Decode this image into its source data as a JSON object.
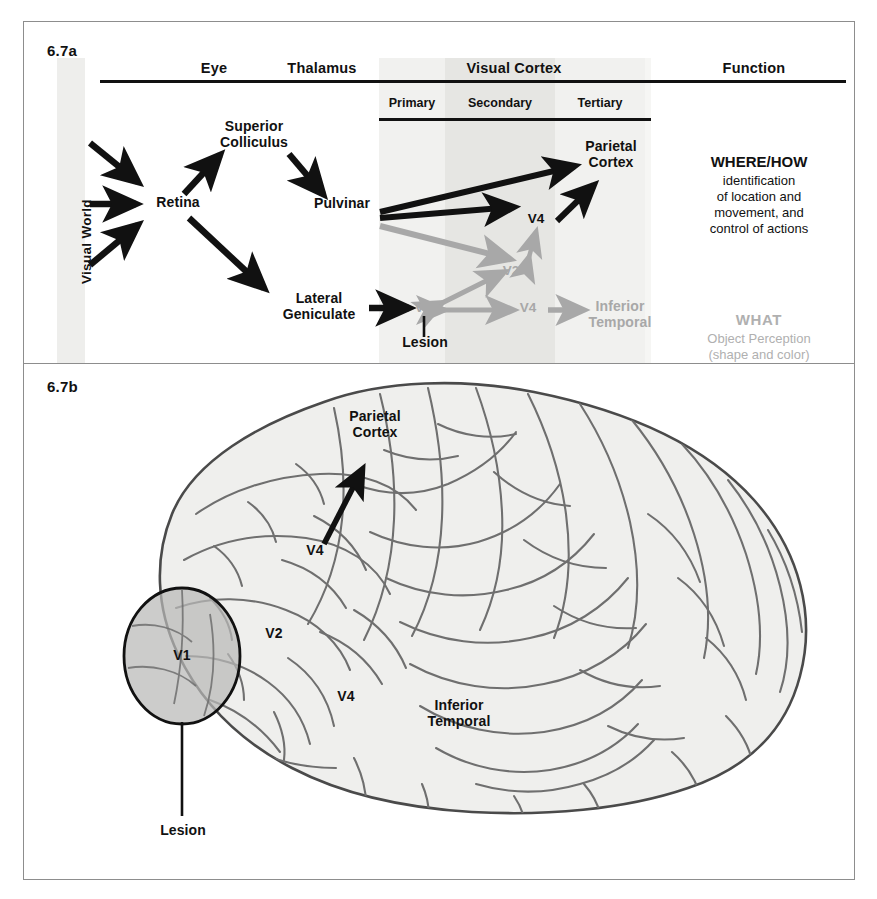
{
  "figure": {
    "panel_a_label": "6.7a",
    "panel_b_label": "6.7b"
  },
  "panel_a": {
    "column_headers": [
      {
        "label": "Eye"
      },
      {
        "label": "Thalamus"
      },
      {
        "label": "Visual Cortex"
      },
      {
        "label": "Function"
      }
    ],
    "cortex_subheaders": [
      {
        "label": "Primary"
      },
      {
        "label": "Secondary"
      },
      {
        "label": "Tertiary"
      }
    ],
    "axis_label": "Visual World",
    "nodes": [
      {
        "id": "retina",
        "label": "Retina",
        "tone": "black"
      },
      {
        "id": "superior-colliculus",
        "label": "Superior\nColliculus",
        "tone": "black"
      },
      {
        "id": "pulvinar",
        "label": "Pulvinar",
        "tone": "black"
      },
      {
        "id": "lateral-geniculate",
        "label": "Lateral\nGeniculate",
        "tone": "black"
      },
      {
        "id": "v1",
        "label": "V1",
        "tone": "gray"
      },
      {
        "id": "v2",
        "label": "V2",
        "tone": "gray"
      },
      {
        "id": "v4-dorsal",
        "label": "V4",
        "tone": "black"
      },
      {
        "id": "v4-ventral",
        "label": "V4",
        "tone": "gray"
      },
      {
        "id": "parietal-cortex",
        "label": "Parietal\nCortex",
        "tone": "black"
      },
      {
        "id": "inferior-temporal",
        "label": "Inferior\nTemporal",
        "tone": "gray"
      },
      {
        "id": "lesion",
        "label": "Lesion",
        "tone": "black"
      }
    ],
    "functions": [
      {
        "id": "where-how",
        "heading": "WHERE/HOW",
        "body": "identification\nof location and\nmovement, and\ncontrol of actions",
        "tone": "black"
      },
      {
        "id": "what",
        "heading": "WHAT",
        "body": "Object Perception\n(shape and color)",
        "tone": "gray"
      }
    ]
  },
  "panel_b": {
    "labels": [
      {
        "id": "parietal-cortex",
        "label": "Parietal\nCortex"
      },
      {
        "id": "v4-dorsal",
        "label": "V4"
      },
      {
        "id": "v2",
        "label": "V2"
      },
      {
        "id": "v4-ventral",
        "label": "V4"
      },
      {
        "id": "v1",
        "label": "V1"
      },
      {
        "id": "inferior-temporal",
        "label": "Inferior\nTemporal"
      },
      {
        "id": "lesion",
        "label": "Lesion"
      }
    ]
  },
  "colors": {
    "black": "#111111",
    "gray_pathway": "#a8a8a8",
    "band_light": "#f0f0ee",
    "band_dark": "#e2e2e0",
    "brain_fill": "#efefed",
    "brain_line": "#6f6f6f",
    "lesion_fill": "#b9b9b7",
    "frame": "#8d8d8d"
  }
}
